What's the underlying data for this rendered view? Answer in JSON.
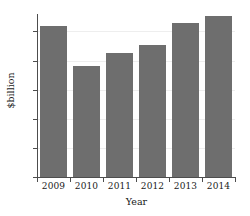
{
  "chart_data": {
    "type": "bar",
    "title": "",
    "subtitle": "",
    "xlabel": "Year",
    "ylabel": "$billion",
    "categories": [
      "2009",
      "2010",
      "2011",
      "2012",
      "2013",
      "2014"
    ],
    "values": [
      10.4,
      7.65,
      8.5,
      9.05,
      10.55,
      11.05
    ],
    "series": [
      {
        "name": "",
        "values": [
          10.4,
          7.65,
          8.5,
          9.05,
          10.55,
          11.05
        ]
      }
    ],
    "ylim": [
      0,
      11.2
    ],
    "yticks": [
      0,
      2,
      4,
      6,
      8,
      10
    ],
    "ytick_labels": [
      "0",
      "2",
      "4",
      "6",
      "8",
      "10"
    ],
    "xtick_labels": [
      "2009",
      "2010",
      "2011",
      "2012",
      "2013",
      "2014"
    ],
    "grid": "horizontal-faint",
    "legend": "none",
    "bar_color": "#6e6e6e",
    "axis_color": "#4d4d4d",
    "gridline_color": "#eeeeee",
    "background_color": "#ffffff",
    "annotations": []
  }
}
